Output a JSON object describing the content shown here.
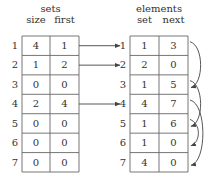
{
  "sets": {
    "title": "sets",
    "columns": [
      "size",
      "first"
    ],
    "rows": [
      {
        "index": "1",
        "size": "4",
        "first": "1"
      },
      {
        "index": "2",
        "size": "1",
        "first": "2"
      },
      {
        "index": "3",
        "size": "0",
        "first": "0"
      },
      {
        "index": "4",
        "size": "2",
        "first": "4"
      },
      {
        "index": "5",
        "size": "0",
        "first": "0"
      },
      {
        "index": "6",
        "size": "0",
        "first": "0"
      },
      {
        "index": "7",
        "size": "0",
        "first": "0"
      }
    ]
  },
  "elements": {
    "title": "elements",
    "columns": [
      "set",
      "next"
    ],
    "rows": [
      {
        "index": "1",
        "set": "1",
        "next": "3"
      },
      {
        "index": "2",
        "set": "2",
        "next": "0"
      },
      {
        "index": "3",
        "set": "1",
        "next": "5"
      },
      {
        "index": "4",
        "set": "4",
        "next": "7"
      },
      {
        "index": "5",
        "set": "1",
        "next": "6"
      },
      {
        "index": "6",
        "set": "1",
        "next": "0"
      },
      {
        "index": "7",
        "set": "4",
        "next": "0"
      }
    ]
  },
  "first_pointers": [
    {
      "from_set": 1,
      "to_element": 1
    },
    {
      "from_set": 2,
      "to_element": 2
    },
    {
      "from_set": 4,
      "to_element": 4
    }
  ],
  "next_pointers": [
    {
      "from": 1,
      "to": 3
    },
    {
      "from": 3,
      "to": 5
    },
    {
      "from": 4,
      "to": 7
    },
    {
      "from": 5,
      "to": 6
    }
  ],
  "colors": {
    "line": "#555555",
    "text": "#333333"
  }
}
